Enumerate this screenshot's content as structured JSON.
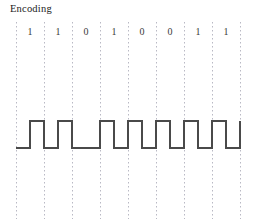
{
  "title": "Encoding",
  "chart_data": {
    "type": "line",
    "title": "Encoding",
    "xlabel": "",
    "ylabel": "",
    "encoding_scheme": "manchester",
    "bits": [
      "1",
      "1",
      "0",
      "1",
      "0",
      "0",
      "1",
      "1"
    ],
    "bit_count": 8,
    "grid": true,
    "gridline_count": 9,
    "gridline_x": [
      16,
      44,
      72,
      100,
      128,
      156,
      184,
      212,
      240
    ],
    "cell_width": 28,
    "signal_levels": {
      "high_y": 121,
      "low_y": 148
    },
    "legend": [],
    "annotations": [],
    "waveform_points": [
      [
        16,
        148
      ],
      [
        30,
        148
      ],
      [
        30,
        121
      ],
      [
        44,
        121
      ],
      [
        44,
        148
      ],
      [
        58,
        148
      ],
      [
        58,
        121
      ],
      [
        72,
        121
      ],
      [
        72,
        148
      ],
      [
        100,
        148
      ],
      [
        100,
        121
      ],
      [
        114,
        121
      ],
      [
        114,
        148
      ],
      [
        128,
        148
      ],
      [
        128,
        121
      ],
      [
        142,
        121
      ],
      [
        142,
        148
      ],
      [
        156,
        148
      ],
      [
        156,
        121
      ],
      [
        170,
        121
      ],
      [
        170,
        148
      ],
      [
        184,
        148
      ],
      [
        184,
        121
      ],
      [
        198,
        121
      ],
      [
        198,
        148
      ],
      [
        212,
        148
      ],
      [
        212,
        121
      ],
      [
        226,
        121
      ],
      [
        226,
        148
      ],
      [
        240,
        148
      ],
      [
        240,
        121
      ]
    ],
    "line_color": "#4a4a4a",
    "grid_color": "#b9b9c4"
  },
  "style": {
    "background": "#ffffff",
    "text_color": "#1a1a1a",
    "bit_label_color": "#3a3a3a"
  }
}
